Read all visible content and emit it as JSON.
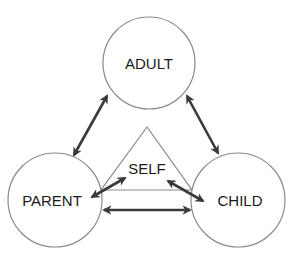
{
  "diagram": {
    "type": "ego-state-triangle",
    "colors": {
      "circle_stroke": "#8a8a8a",
      "arrow": "#3a3a3a",
      "text": "#1a1a1a",
      "background": "#ffffff"
    },
    "nodes": [
      {
        "id": "adult",
        "label": "ADULT",
        "cx": 149,
        "cy": 63,
        "r": 46
      },
      {
        "id": "parent",
        "label": "PARENT",
        "cx": 55,
        "cy": 200,
        "r": 47
      },
      {
        "id": "child",
        "label": "CHILD",
        "cx": 238,
        "cy": 200,
        "r": 47
      }
    ],
    "center": {
      "id": "self",
      "label": "SELF",
      "x": 147,
      "y": 156
    },
    "triangle": {
      "apex": [
        147,
        127
      ],
      "base_left": [
        101,
        190
      ],
      "base_right": [
        192,
        190
      ]
    },
    "edges": [
      {
        "from": "parent",
        "to": "adult",
        "bidirectional": true
      },
      {
        "from": "adult",
        "to": "child",
        "bidirectional": true
      },
      {
        "from": "parent",
        "to": "child",
        "bidirectional": true
      },
      {
        "from": "parent",
        "to": "self",
        "bidirectional": true
      },
      {
        "from": "self",
        "to": "child",
        "bidirectional": true
      }
    ]
  }
}
